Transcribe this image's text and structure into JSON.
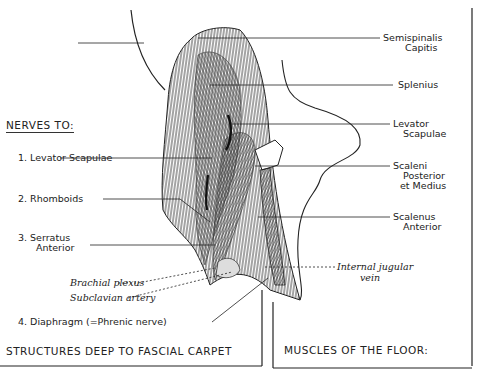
{
  "figure": {
    "nerves_heading": "NERVES TO:",
    "nerves": [
      {
        "label": "1. Levator Scapulae"
      },
      {
        "label": "2. Rhomboids"
      },
      {
        "label": "3. Serratus",
        "label2": "Anterior"
      },
      {
        "label": "4. Diaphragm (=Phrenic nerve)"
      }
    ],
    "deep_structures": [
      {
        "label": "Brachial plexus"
      },
      {
        "label": "Subclavian artery"
      }
    ],
    "muscles": [
      {
        "label": "Semispinalis",
        "label2": "Capitis"
      },
      {
        "label": "Splenius"
      },
      {
        "label": "Levator",
        "label2": "Scapulae"
      },
      {
        "label": "Scaleni",
        "label2": "Posterior",
        "label3": "et Medius"
      },
      {
        "label": "Scalenus",
        "label2": "Anterior"
      }
    ],
    "vein": {
      "label": "Internal jugular",
      "label2": "vein"
    },
    "footer_left": "STRUCTURES DEEP TO FASCIAL CARPET",
    "footer_right": "MUSCLES OF THE FLOOR:"
  },
  "colors": {
    "ink": "#1a1a1a",
    "paper": "#ffffff"
  }
}
